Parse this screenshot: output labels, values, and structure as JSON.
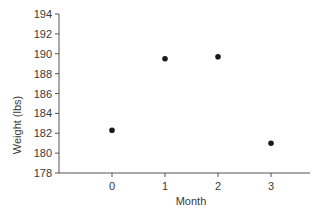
{
  "chart_data": {
    "type": "scatter",
    "title": "",
    "xlabel": "Month",
    "ylabel": "Weight (lbs)",
    "x": [
      0,
      1,
      2,
      3
    ],
    "y": [
      182.3,
      189.5,
      189.7,
      181.0
    ],
    "series": [
      {
        "name": "Weight",
        "x": [
          0,
          1,
          2,
          3
        ],
        "values": [
          182.3,
          189.5,
          189.7,
          181.0
        ]
      }
    ],
    "xticks": [
      "0",
      "1",
      "2",
      "3"
    ],
    "yticks": [
      "178",
      "180",
      "182",
      "184",
      "186",
      "188",
      "190",
      "192",
      "194"
    ],
    "ylim": [
      178,
      194
    ],
    "xlim": [
      -1.0,
      3.8
    ],
    "grid": false,
    "legend": null,
    "colors": {
      "point": "#1a1a1a",
      "axis": "#555555",
      "text": "#3a3a3a"
    }
  }
}
